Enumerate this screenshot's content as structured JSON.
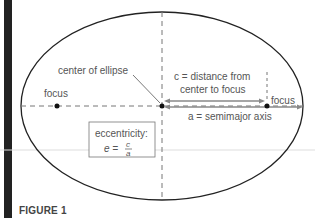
{
  "figure": {
    "caption": "FIGURE 1",
    "labels": {
      "center": "center of ellipse",
      "focus_left": "focus",
      "focus_right": "focus",
      "c_line1": "c = distance from",
      "c_line2": "center to focus",
      "a_label": "a = semimajor axis",
      "ecc_title": "eccentricity:",
      "ecc_formula_lhs": "e =",
      "ecc_num": "c",
      "ecc_den": "a"
    },
    "colors": {
      "outline": "#222222",
      "dashed": "#777777",
      "arrow": "#888888",
      "text": "#555555",
      "bar": "#222222"
    }
  }
}
